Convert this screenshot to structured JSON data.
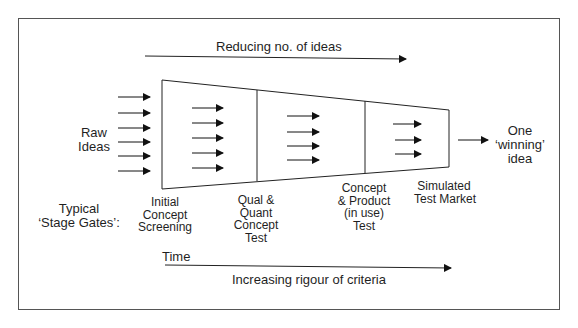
{
  "diagram": {
    "top_arrow_label": "Reducing no. of ideas",
    "input_label": {
      "line1": "Raw",
      "line2": "Ideas"
    },
    "output_label": {
      "line1": "One",
      "line2": "‘winning’",
      "line3": "idea"
    },
    "gates_heading": {
      "line1": "Typical",
      "line2": "‘Stage Gates’:"
    },
    "stages": [
      {
        "line1": "Initial",
        "line2": "Concept",
        "line3": "Screening"
      },
      {
        "line1": "Qual &",
        "line2": "Quant",
        "line3": "Concept",
        "line4": "Test"
      },
      {
        "line1": "Concept",
        "line2": "& Product",
        "line3": "(in use)",
        "line4": "Test"
      },
      {
        "line1": "Simulated",
        "line2": "Test Market"
      }
    ],
    "time_label": "Time",
    "bottom_arrow_label": "Increasing rigour of criteria",
    "arrow_counts": {
      "input": 6,
      "stage1": 5,
      "stage2": 4,
      "stage3": 3,
      "output": 1
    },
    "colors": {
      "line": "#1a1a1a",
      "frame": "#555555",
      "background": "#ffffff"
    }
  }
}
